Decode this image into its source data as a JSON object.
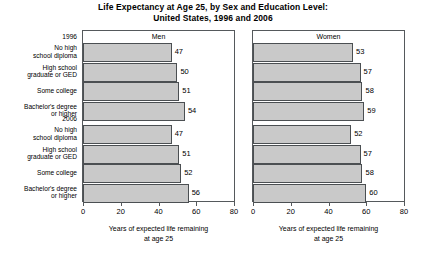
{
  "chart_data": {
    "type": "bar",
    "orientation": "horizontal",
    "title": "Life Expectancy at Age 25, by Sex and Education Level:\nUnited States, 1996 and 2006",
    "title_line1": "Life Expectancy at Age 25, by Sex and Education Level:",
    "title_line2": "United States, 1996 and 2006",
    "xlabel": "Years of expected life remaining at age 25",
    "xlabel_line1": "Years of expected life remaining",
    "xlabel_line2": "at age 25",
    "ylabel": "",
    "xlim": [
      0,
      80
    ],
    "xticks": [
      0,
      20,
      40,
      60,
      80
    ],
    "xtick_labels": [
      "0",
      "20",
      "40",
      "60",
      "80"
    ],
    "grid": false,
    "legend": "none",
    "bar_color": "#c9c9c9",
    "bar_edge_color": "#4b4f52",
    "panels": [
      {
        "name": "Men",
        "groups": [
          {
            "year": "1996",
            "categories": [
              "No high school diploma",
              "High school graduate or GED",
              "Some college",
              "Bachelor's degree or higher"
            ],
            "values": [
              47,
              50,
              51,
              54
            ]
          },
          {
            "year": "2006",
            "categories": [
              "No high school diploma",
              "High school graduate or GED",
              "Some college",
              "Bachelor's degree or higher"
            ],
            "values": [
              47,
              51,
              52,
              56
            ]
          }
        ]
      },
      {
        "name": "Women",
        "groups": [
          {
            "year": "1996",
            "categories": [
              "No high school diploma",
              "High school graduate or GED",
              "Some college",
              "Bachelor's degree or higher"
            ],
            "values": [
              53,
              57,
              58,
              59
            ]
          },
          {
            "year": "2006",
            "categories": [
              "No high school diploma",
              "High school graduate or GED",
              "Some college",
              "Bachelor's degree or higher"
            ],
            "values": [
              52,
              57,
              58,
              60
            ]
          }
        ]
      }
    ]
  },
  "category_axis": {
    "groups": [
      {
        "year_label": "1996",
        "labels": [
          [
            "No high",
            "school diploma"
          ],
          [
            "High school",
            "graduate or GED"
          ],
          [
            "Some college"
          ],
          [
            "Bachelor's degree",
            "or higher"
          ]
        ]
      },
      {
        "year_label": "2006",
        "labels": [
          [
            "No high",
            "school diploma"
          ],
          [
            "High school",
            "graduate or GED"
          ],
          [
            "Some college"
          ],
          [
            "Bachelor's degree",
            "or higher"
          ]
        ]
      }
    ]
  }
}
